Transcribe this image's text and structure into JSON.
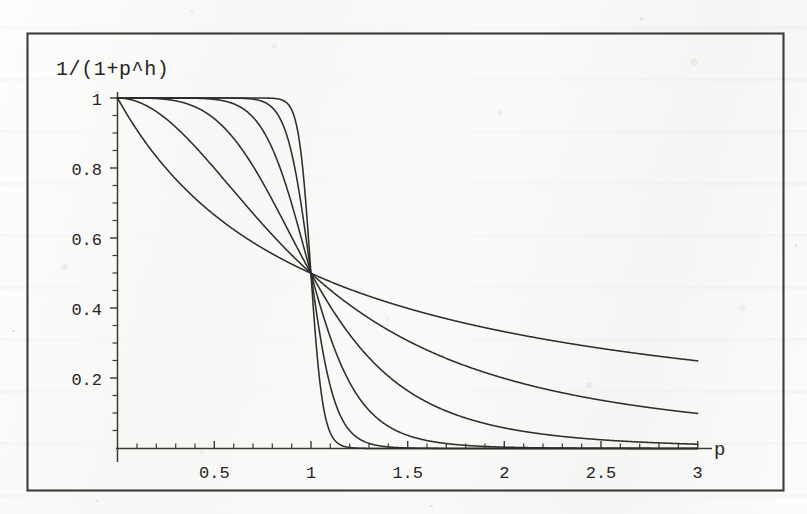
{
  "figure": {
    "kind": "scanned-mathematica-plot",
    "frame": {
      "visible": true,
      "color": "#3a3a3a"
    },
    "background_color": "#fbfbfa",
    "ink_color": "#2b2b2b"
  },
  "chart_data": {
    "type": "line",
    "title": "",
    "subtitle": "",
    "ylabel": "1/(1+p^h)",
    "xlabel": "p",
    "xlim": [
      0,
      3
    ],
    "ylim": [
      0,
      1.02
    ],
    "grid": false,
    "legend": "none",
    "xticks": [
      0.5,
      1,
      1.5,
      2,
      2.5,
      3
    ],
    "xtick_labels": [
      "0.5",
      "1",
      "1.5",
      "2",
      "2.5",
      "3"
    ],
    "yticks": [
      0.2,
      0.4,
      0.6,
      0.8,
      1
    ],
    "ytick_labels": [
      "0.2",
      "0.4",
      "0.6",
      "0.8",
      "1"
    ],
    "minor_tick_step_x": 0.1,
    "minor_tick_step_y": 0.05,
    "annotations": [
      {
        "text": "all curves pass through (1, 0.5)",
        "x": 1,
        "y": 0.5
      }
    ],
    "formula": "y = 1 / (1 + p^h)",
    "series": [
      {
        "name": "h = 1",
        "h": 1,
        "x": [
          0,
          0.25,
          0.5,
          0.75,
          1,
          1.25,
          1.5,
          2,
          2.5,
          3
        ],
        "values": [
          1,
          0.8,
          0.667,
          0.571,
          0.5,
          0.444,
          0.4,
          0.333,
          0.286,
          0.25
        ]
      },
      {
        "name": "h = 2",
        "h": 2,
        "x": [
          0,
          0.25,
          0.5,
          0.75,
          1,
          1.25,
          1.5,
          2,
          2.5,
          3
        ],
        "values": [
          1,
          0.941,
          0.8,
          0.64,
          0.5,
          0.39,
          0.308,
          0.2,
          0.138,
          0.1
        ]
      },
      {
        "name": "h = 4",
        "h": 4,
        "x": [
          0,
          0.25,
          0.5,
          0.75,
          1,
          1.25,
          1.5,
          2,
          2.5,
          3
        ],
        "values": [
          1,
          0.996,
          0.941,
          0.76,
          0.5,
          0.291,
          0.165,
          0.059,
          0.025,
          0.012
        ]
      },
      {
        "name": "h = 8",
        "h": 8,
        "x": [
          0,
          0.25,
          0.5,
          0.75,
          1,
          1.25,
          1.5,
          2,
          2.5,
          3
        ],
        "values": [
          1,
          1.0,
          0.996,
          0.909,
          0.5,
          0.143,
          0.038,
          0.004,
          0.001,
          0.0
        ]
      },
      {
        "name": "h = 16",
        "h": 16,
        "x": [
          0,
          0.25,
          0.5,
          0.75,
          1,
          1.25,
          1.5,
          2,
          2.5,
          3
        ],
        "values": [
          1,
          1.0,
          1.0,
          0.99,
          0.5,
          0.024,
          0.002,
          0.0,
          0.0,
          0.0
        ]
      },
      {
        "name": "h = 32",
        "h": 32,
        "x": [
          0,
          0.25,
          0.5,
          0.75,
          1,
          1.25,
          1.5,
          2,
          2.5,
          3
        ],
        "values": [
          1,
          1.0,
          1.0,
          0.9999,
          0.5,
          0.0006,
          0.0,
          0.0,
          0.0,
          0.0
        ]
      }
    ],
    "endpoint_values_at_p3": [
      0.25,
      0.1,
      0.012,
      0.0,
      0.0,
      0.0
    ]
  }
}
